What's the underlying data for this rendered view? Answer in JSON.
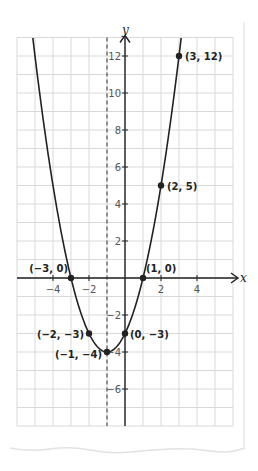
{
  "chart_data": {
    "type": "line",
    "title": "",
    "function": "y = x^2 + 2x - 3",
    "xlabel": "x",
    "ylabel": "y",
    "xlim": [
      -6,
      6
    ],
    "ylim": [
      -8,
      13
    ],
    "grid": true,
    "grid_step": 1,
    "x_ticks": [
      -4,
      -2,
      2,
      4
    ],
    "x_tick_labels": [
      "−4",
      "−2",
      "2",
      "4"
    ],
    "y_ticks": [
      12,
      10,
      8,
      6,
      4,
      2,
      -2,
      -4,
      -6
    ],
    "y_tick_labels": [
      "12",
      "10",
      "8",
      "6",
      "4",
      "2",
      "−2",
      "−4",
      "−6"
    ],
    "axis_of_symmetry": {
      "x": -1,
      "style": "dashed"
    },
    "points": [
      {
        "x": -3,
        "y": 0,
        "label": "(−3, 0)"
      },
      {
        "x": 1,
        "y": 0,
        "label": "(1, 0)"
      },
      {
        "x": -2,
        "y": -3,
        "label": "(−2, −3)"
      },
      {
        "x": 0,
        "y": -3,
        "label": "(0, −3)"
      },
      {
        "x": -1,
        "y": -4,
        "label": "(−1, −4)"
      },
      {
        "x": 2,
        "y": 5,
        "label": "(2, 5)"
      },
      {
        "x": 3,
        "y": 12,
        "label": "(3, 12)"
      }
    ],
    "series": [
      {
        "name": "parabola",
        "equation": "y = x^2 + 2x - 3",
        "x_range": [
          -5.12,
          3.12
        ]
      }
    ]
  },
  "colors": {
    "grid": "#d9d9d9",
    "axis": "#222222",
    "curve": "#222222",
    "paper_edge": "#e6e6e6"
  }
}
